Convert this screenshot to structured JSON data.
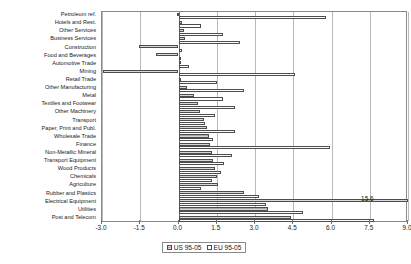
{
  "chart_data": {
    "type": "bar",
    "orientation": "horizontal",
    "title": "",
    "xlabel": "",
    "ylabel": "",
    "xlim": [
      -3.0,
      9.0
    ],
    "xticks": [
      "-3.0",
      "-1.5",
      "0.0",
      "1.5",
      "3.0",
      "4.5",
      "6.0",
      "7.5",
      "9.0"
    ],
    "xtick_values": [
      -3.0,
      -1.5,
      0.0,
      1.5,
      3.0,
      4.5,
      6.0,
      7.5,
      9.0
    ],
    "grid": true,
    "legend_position": "bottom-center",
    "categories": [
      "Petroleum ref.",
      "Hotels and Rest.",
      "Other Services",
      "Business Services",
      "Construction",
      "Food and Beverages",
      "Automotive Trade",
      "Mining",
      "Retail Trade",
      "Other Manufacturing",
      "Metal",
      "Textiles and Footwear",
      "Other Machinery",
      "Transport",
      "Paper, Print and Publ.",
      "Wholesale Trade",
      "Finance",
      "Non-Metallic Mineral",
      "Transport Equipment",
      "Wood Products",
      "Chemicals",
      "Agriculture",
      "Rubber and Plastics",
      "Electrical Equipment",
      "Utilities",
      "Post and Telecom"
    ],
    "series": [
      {
        "name": "US 95-05",
        "values": [
          -0.05,
          0.15,
          0.2,
          0.25,
          -1.55,
          -0.9,
          0.05,
          -2.95,
          0.1,
          0.35,
          0.6,
          0.75,
          0.85,
          1.0,
          1.1,
          1.2,
          1.25,
          1.3,
          1.35,
          1.45,
          1.5,
          1.55,
          2.55,
          15.6,
          3.5,
          4.4
        ]
      },
      {
        "name": "EU 95-05",
        "values": [
          5.8,
          0.9,
          1.75,
          2.4,
          0.15,
          0.05,
          0.4,
          4.55,
          1.5,
          2.55,
          1.75,
          2.2,
          1.45,
          1.05,
          2.2,
          1.35,
          5.95,
          2.1,
          1.8,
          1.65,
          1.3,
          0.9,
          3.15,
          3.45,
          4.9,
          7.65
        ]
      }
    ],
    "annotations": [
      {
        "text": "15.6",
        "series": "US 95-05",
        "category": "Electrical Equipment",
        "value": 15.6
      }
    ]
  },
  "legend": {
    "items": [
      {
        "label": "US 95-05",
        "style": "hatched-gray",
        "color": "#a8a8a8"
      },
      {
        "label": "EU 95-05",
        "style": "white",
        "color": "#ffffff"
      }
    ]
  }
}
